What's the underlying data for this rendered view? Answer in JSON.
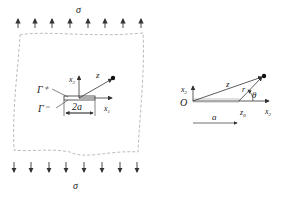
{
  "left_figure": {
    "stress_top": "σ",
    "stress_bottom": "σ",
    "gamma_plus": "Γ⁺",
    "gamma_minus": "Γ⁻",
    "x2": "x",
    "x2_sub": "2",
    "x1": "x",
    "x1_sub": "1",
    "z": "z",
    "crack_length": "2a"
  },
  "right_figure": {
    "origin": "O",
    "x2": "x",
    "x2_sub": "2",
    "x1": "x",
    "x1_sub": "1",
    "z": "z",
    "r": "r",
    "theta": "θ",
    "a": "a",
    "z0": "z",
    "z0_sub": "0"
  },
  "colors": {
    "line": "#333333",
    "dash": "#aaaaaa"
  }
}
